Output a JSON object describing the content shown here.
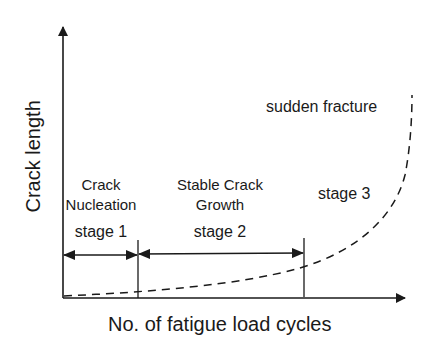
{
  "diagram": {
    "y_axis_label": "Crack length",
    "x_axis_label": "No. of fatigue load cycles",
    "annotation_top": "sudden fracture",
    "stages": [
      {
        "id": "stage1",
        "title_line1": "Crack",
        "title_line2": "Nucleation",
        "label": "stage 1"
      },
      {
        "id": "stage2",
        "title_line1": "Stable Crack",
        "title_line2": "Growth",
        "label": "stage 2"
      },
      {
        "id": "stage3",
        "label": "stage 3"
      }
    ],
    "colors": {
      "line": "#1a1a1a",
      "background": "#ffffff"
    }
  }
}
